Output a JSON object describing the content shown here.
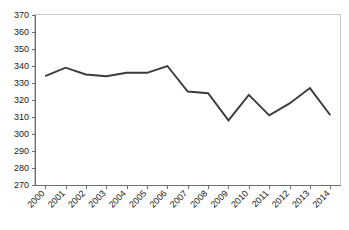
{
  "chart_data": {
    "type": "line",
    "title": "",
    "subtitle": "",
    "xlabel": "",
    "ylabel": "",
    "categories": [
      "2000",
      "2001",
      "2002",
      "2003",
      "2004",
      "2005",
      "2006",
      "2007",
      "2008",
      "2009",
      "2010",
      "2011",
      "2012",
      "2013",
      "2014"
    ],
    "series": [
      {
        "name": "series-1",
        "values": [
          334,
          339,
          335,
          334,
          336,
          336,
          340,
          325,
          324,
          308,
          323,
          311,
          318,
          327,
          311
        ],
        "color": "#3b3b3b"
      }
    ],
    "ylim": [
      270,
      370
    ],
    "yticks": [
      270,
      280,
      290,
      300,
      310,
      320,
      330,
      340,
      350,
      360,
      370
    ],
    "ytick_labels": [
      "270",
      "280",
      "290",
      "300",
      "310",
      "320",
      "330",
      "340",
      "350",
      "360",
      "370"
    ],
    "xtick_labels": [
      "2000",
      "2001",
      "2002",
      "2003",
      "2004",
      "2005",
      "2006",
      "2007",
      "2008",
      "2009",
      "2010",
      "2011",
      "2012",
      "2013",
      "2014"
    ],
    "grid": false,
    "legend": false,
    "legend_position": "none",
    "xtick_label_rotation": -45,
    "plot_border_color": "#c9c9c9",
    "axis_color": "#6e6e6e",
    "background_color": "#ffffff"
  }
}
